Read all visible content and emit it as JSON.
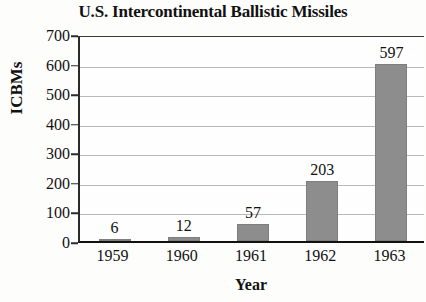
{
  "chart_data": {
    "type": "bar",
    "title": "U.S. Intercontinental Ballistic Missiles",
    "xlabel": "Year",
    "ylabel": "ICBMs",
    "categories": [
      "1959",
      "1960",
      "1961",
      "1962",
      "1963"
    ],
    "values": [
      6,
      12,
      57,
      203,
      597
    ],
    "value_labels": [
      "6",
      "12",
      "57",
      "203",
      "597"
    ],
    "ylim": [
      0,
      700
    ],
    "ytick_labels": [
      "700",
      "600",
      "500",
      "400",
      "300",
      "200",
      "100",
      "0"
    ],
    "ytick_values": [
      700,
      600,
      500,
      400,
      300,
      200,
      100,
      0
    ],
    "grid": true,
    "legend": null,
    "bar_color": "#8d8d8d",
    "axis_color": "#111111",
    "gridline_color": "#b9b9b9",
    "background": "#fdfdfc"
  }
}
